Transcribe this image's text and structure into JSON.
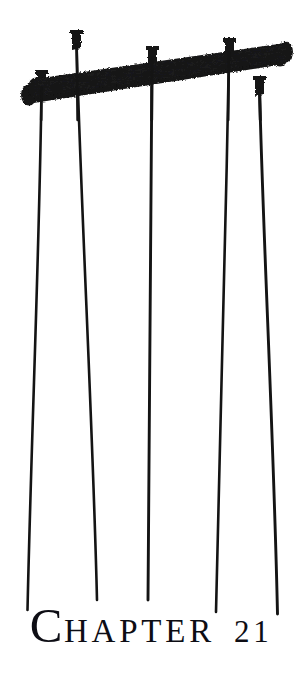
{
  "page": {
    "width": 302,
    "height": 686,
    "background_color": "#ffffff",
    "ink_color": "#141414",
    "text_color": "#0d0d14"
  },
  "heading": {
    "full_text": "CHAPTER 21",
    "drop_cap": "C",
    "word_rest": "HAPTER",
    "number": "21"
  },
  "illustration": {
    "name": "crossed-beams-with-hanging-strings",
    "description": "Two crossed wooden beams with five pegs and five hanging strings",
    "beam_count": 2,
    "peg_count": 5,
    "string_count": 5,
    "beams": [
      {
        "name": "upper-beam",
        "x1": 34,
        "y1": 88,
        "x2": 286,
        "y2": 52,
        "thickness": 19
      },
      {
        "name": "lower-beam",
        "x1": 27,
        "y1": 95,
        "x2": 281,
        "y2": 56,
        "thickness": 19
      }
    ],
    "pegs": [
      {
        "name": "peg-1",
        "x": 41,
        "y": 86
      },
      {
        "name": "peg-2",
        "x": 76,
        "y": 43
      },
      {
        "name": "peg-3",
        "x": 152,
        "y": 59
      },
      {
        "name": "peg-4",
        "x": 229,
        "y": 52
      },
      {
        "name": "peg-5",
        "x": 259,
        "y": 88
      }
    ],
    "strings": [
      {
        "name": "string-1",
        "x_top": 41,
        "y_top": 95,
        "x_bottom": 27,
        "y_bottom": 610
      },
      {
        "name": "string-2",
        "x_top": 76,
        "y_top": 52,
        "x_bottom": 97,
        "y_bottom": 600
      },
      {
        "name": "string-3",
        "x_top": 152,
        "y_top": 66,
        "x_bottom": 148,
        "y_bottom": 600
      },
      {
        "name": "string-4",
        "x_top": 229,
        "y_top": 60,
        "x_bottom": 216,
        "y_bottom": 612
      },
      {
        "name": "string-5",
        "x_top": 259,
        "y_top": 96,
        "x_bottom": 277,
        "y_bottom": 614
      }
    ]
  }
}
